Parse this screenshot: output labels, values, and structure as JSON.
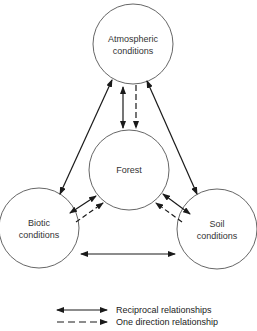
{
  "nodes": {
    "atmospheric": {
      "line1": "Atmospheric",
      "line2": "conditions"
    },
    "forest": {
      "line1": "Forest"
    },
    "biotic": {
      "line1": "Biotic",
      "line2": "conditions"
    },
    "soil": {
      "line1": "Soil",
      "line2": "conditions"
    }
  },
  "legend": {
    "reciprocal": "Reciprocal relationships",
    "one_direction": "One direction relationship"
  },
  "colors": {
    "stroke": "#1a1a1a",
    "circle": "#555555",
    "background": "#ffffff"
  }
}
